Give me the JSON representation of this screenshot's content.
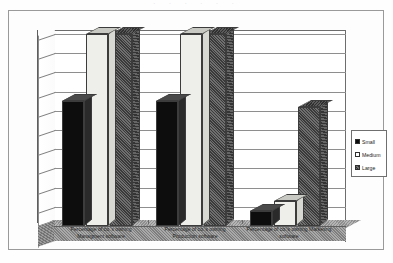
{
  "page": {
    "top_caption_fragment": "· ·      ·        ·     ·            ·"
  },
  "legend": {
    "position": "right",
    "items": [
      {
        "label": "Small",
        "swatch": "legend-swatch-small",
        "color": "#0d0d0d"
      },
      {
        "label": "Medium",
        "swatch": "legend-swatch-medium",
        "color": "#ffffff"
      },
      {
        "label": "Large",
        "swatch": "legend-swatch-large",
        "color": "#545454"
      }
    ]
  },
  "axis": {
    "y_ticks": [
      "100%",
      "90%",
      "80%",
      "70%",
      "60%",
      "50%",
      "40%",
      "30%",
      "20%",
      "10%",
      "0%"
    ]
  },
  "categories_display": [
    "Percentage of co.'s owning\nManagment software",
    "Percentage of co.'s owning\nProduction software",
    "Percentage of co.'s owning Marketing\nsoftware"
  ],
  "chart_data": {
    "type": "bar",
    "title": "",
    "subtitle": "",
    "xlabel": "",
    "ylabel": "",
    "ylim": [
      0,
      100
    ],
    "y_tick_values": [
      0,
      10,
      20,
      30,
      40,
      50,
      60,
      70,
      80,
      90,
      100
    ],
    "y_tick_labels": [
      "0%",
      "10%",
      "20%",
      "30%",
      "40%",
      "50%",
      "60%",
      "70%",
      "80%",
      "90%",
      "100%"
    ],
    "grid": true,
    "legend_position": "right",
    "style": "3d-column",
    "categories": [
      "Percentage of co.'s owning Managment software",
      "Percentage of co.'s owning Production software",
      "Percentage of co.'s owning Marketing software"
    ],
    "series": [
      {
        "name": "Small",
        "color": "#0d0d0d",
        "values": [
          65,
          65,
          8
        ]
      },
      {
        "name": "Medium",
        "color": "#eeeeea",
        "values": [
          100,
          100,
          13
        ]
      },
      {
        "name": "Large",
        "color": "#545454",
        "values": [
          100,
          100,
          62
        ]
      }
    ]
  }
}
